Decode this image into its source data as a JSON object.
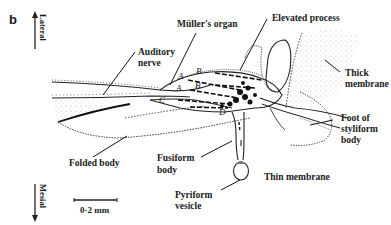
{
  "figure": {
    "panel_label": "b",
    "orientation": {
      "top": "Lateral",
      "bottom": "Mesial"
    },
    "scale_bar": "0·2 mm",
    "labels": {
      "muller_organ": "Müller's organ",
      "elevated_process": "Elevated process",
      "auditory_nerve_1": "Auditory",
      "auditory_nerve_2": "nerve",
      "thick_membrane_1": "Thick",
      "thick_membrane_2": "membrane",
      "foot_1": "Foot of",
      "foot_2": "styliform",
      "foot_3": "body",
      "folded_body": "Folded body",
      "fusiform_1": "Fusiform",
      "fusiform_2": "body",
      "pyriform_1": "Pyriform",
      "pyriform_2": "vesicle",
      "thin_membrane": "Thin membrane"
    },
    "cell_group_letters": {
      "a1": "A",
      "a2": "A",
      "b1": "B",
      "b2": "B",
      "c": "C",
      "d": "D"
    }
  }
}
